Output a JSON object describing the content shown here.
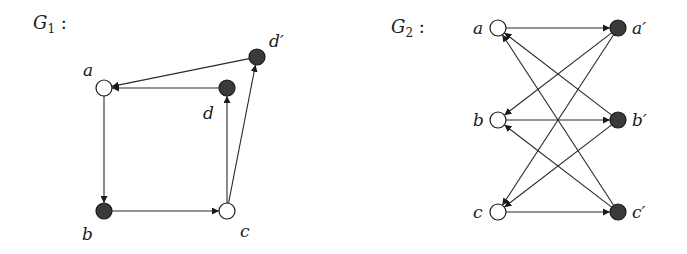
{
  "colors": {
    "filled_node": "#3a3a3a",
    "empty_node": "#ffffff",
    "stroke": "#1a1a1a",
    "background": "#ffffff"
  },
  "graphs": [
    {
      "id": "G1",
      "title": "G",
      "title_sub": "1",
      "title_suffix": " :",
      "title_pos": [
        33,
        29
      ],
      "nodes": [
        {
          "id": "a",
          "label": "a",
          "x": 104,
          "y": 88,
          "filled": false,
          "label_pos": [
            83,
            76
          ]
        },
        {
          "id": "d",
          "label": "d",
          "x": 227,
          "y": 88,
          "filled": true,
          "label_pos": [
            203,
            119
          ]
        },
        {
          "id": "d'",
          "label": "d′",
          "x": 257,
          "y": 57,
          "filled": true,
          "label_pos": [
            269,
            47
          ]
        },
        {
          "id": "b",
          "label": "b",
          "x": 104,
          "y": 211,
          "filled": true,
          "label_pos": [
            82,
            240
          ]
        },
        {
          "id": "c",
          "label": "c",
          "x": 227,
          "y": 211,
          "filled": false,
          "label_pos": [
            240,
            237
          ]
        }
      ],
      "edges": [
        {
          "from": "a",
          "to": "b"
        },
        {
          "from": "b",
          "to": "c"
        },
        {
          "from": "c",
          "to": "d"
        },
        {
          "from": "c",
          "to": "d'"
        },
        {
          "from": "d",
          "to": "a"
        },
        {
          "from": "d'",
          "to": "a"
        }
      ]
    },
    {
      "id": "G2",
      "title": "G",
      "title_sub": "2",
      "title_suffix": " :",
      "title_pos": [
        391,
        33
      ],
      "nodes": [
        {
          "id": "a",
          "label": "a",
          "x": 498,
          "y": 28,
          "filled": false,
          "label_pos": [
            473,
            34
          ]
        },
        {
          "id": "b",
          "label": "b",
          "x": 498,
          "y": 120,
          "filled": false,
          "label_pos": [
            473,
            126
          ]
        },
        {
          "id": "c",
          "label": "c",
          "x": 498,
          "y": 212,
          "filled": false,
          "label_pos": [
            473,
            218
          ]
        },
        {
          "id": "a'",
          "label": "a′",
          "x": 618,
          "y": 28,
          "filled": true,
          "label_pos": [
            632,
            34
          ]
        },
        {
          "id": "b'",
          "label": "b′",
          "x": 618,
          "y": 120,
          "filled": true,
          "label_pos": [
            632,
            126
          ]
        },
        {
          "id": "c'",
          "label": "c′",
          "x": 618,
          "y": 212,
          "filled": true,
          "label_pos": [
            632,
            218
          ]
        }
      ],
      "edges": [
        {
          "from": "a",
          "to": "a'"
        },
        {
          "from": "b",
          "to": "b'"
        },
        {
          "from": "c",
          "to": "c'"
        },
        {
          "from": "a'",
          "to": "b"
        },
        {
          "from": "a'",
          "to": "c"
        },
        {
          "from": "b'",
          "to": "a"
        },
        {
          "from": "b'",
          "to": "c"
        },
        {
          "from": "c'",
          "to": "a"
        },
        {
          "from": "c'",
          "to": "b"
        }
      ]
    }
  ],
  "node_radius": 8
}
